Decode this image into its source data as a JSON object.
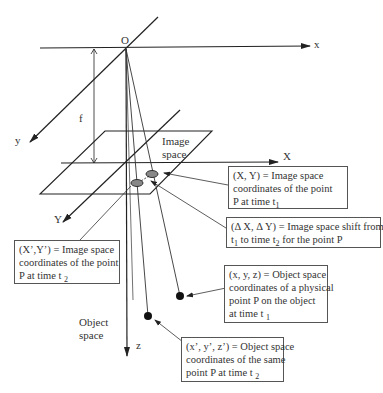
{
  "diagram": {
    "axis_labels": {
      "origin": "O",
      "x": "x",
      "y": "y",
      "z": "z",
      "image_X": "X",
      "image_Y": "Y",
      "focal_length": "f"
    },
    "region_labels": {
      "image_space_line1": "Image",
      "image_space_line2": "space",
      "object_space_line1": "Object",
      "object_space_line2": "space"
    },
    "callouts": {
      "image_t1": {
        "line1": "(X, Y) = Image space",
        "line2": "coordinates of the point",
        "line3_text": "P at time t",
        "line3_sub": "1"
      },
      "shift": {
        "line1": "(Δ X, Δ Y) = Image space shift from time",
        "line2_pre": "t",
        "line2_sub1": "1",
        "line2_mid": " to time t",
        "line2_sub2": "2",
        "line2_post": " for the point P"
      },
      "image_t2": {
        "line1": "(X’,Y’) = Image space",
        "line2": "coordinates of the point",
        "line3_text": "P at time t ",
        "line3_sub": "2"
      },
      "object_t1": {
        "line1": "(x, y, z) = Object space",
        "line2": "coordinates of a physical",
        "line3": "point P on the object",
        "line4_text": "at time t ",
        "line4_sub": "1"
      },
      "object_t2": {
        "line1": "(x’, y’, z’) = Object space",
        "line2": "coordinates of the same",
        "line3_text": "point P at time t ",
        "line3_sub": "2"
      }
    },
    "colors": {
      "line": "#222222",
      "box_border": "#555555",
      "point_fill": "#111111",
      "ellipse_fill": "#777777"
    }
  }
}
